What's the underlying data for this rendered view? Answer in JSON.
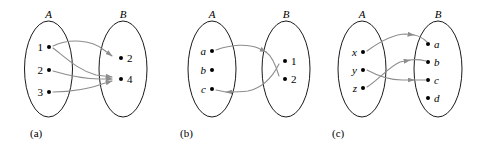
{
  "figure": {
    "background_color": "#ffffff",
    "oval_stroke_color": "#000000",
    "dot_color": "#000000",
    "arrow_color": "#8d8d8d"
  },
  "panels": [
    {
      "caption": "(a)",
      "left_set": {
        "label": "A",
        "elements": [
          "1",
          "2",
          "3"
        ],
        "italic": false
      },
      "right_set": {
        "label": "B",
        "elements": [
          "2",
          "4"
        ],
        "italic": false
      },
      "arrows": [
        {
          "from": "1",
          "to": "2"
        },
        {
          "from": "1",
          "to": "4"
        },
        {
          "from": "2",
          "to": "4"
        },
        {
          "from": "3",
          "to": "4"
        }
      ]
    },
    {
      "caption": "(b)",
      "left_set": {
        "label": "A",
        "elements": [
          "a",
          "b",
          "c"
        ],
        "italic": true
      },
      "right_set": {
        "label": "B",
        "elements": [
          "1",
          "2"
        ],
        "italic": false
      },
      "arrows": [
        {
          "from": "a",
          "to": "2"
        },
        {
          "from": "c",
          "to": "1"
        }
      ]
    },
    {
      "caption": "(c)",
      "left_set": {
        "label": "A",
        "elements": [
          "x",
          "y",
          "z"
        ],
        "italic": true
      },
      "right_set": {
        "label": "B",
        "elements": [
          "a",
          "b",
          "c",
          "d"
        ],
        "italic": true
      },
      "arrows": [
        {
          "from": "x",
          "to": "a"
        },
        {
          "from": "y",
          "to": "c"
        },
        {
          "from": "z",
          "to": "b"
        }
      ]
    }
  ]
}
